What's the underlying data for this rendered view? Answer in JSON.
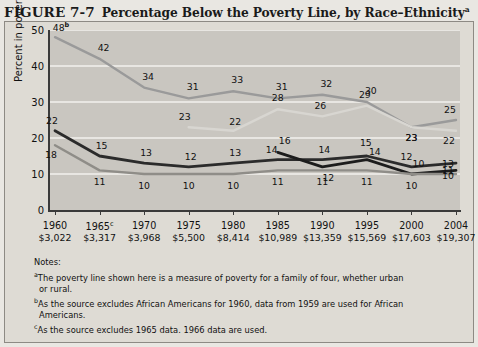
{
  "figure": {
    "number": "FIGURE 7-7",
    "title": "Percentage Below the Poverty Line, by Race–Ethnicity",
    "title_superscript": "a"
  },
  "legend": {
    "position": "top-right",
    "entries": [
      {
        "label": "African Americans",
        "color": "#9a9a9a",
        "weight": "medium"
      },
      {
        "label": "Asian Americans",
        "color": "#1c1c1c",
        "weight": "thick"
      },
      {
        "label": "Latinos",
        "color": "#d8d6d1",
        "weight": "medium"
      },
      {
        "label": "Whites",
        "color": "#8f8d88",
        "weight": "medium"
      },
      {
        "label": "National Average",
        "color": "#2b2b2b",
        "weight": "thick"
      }
    ]
  },
  "notes": {
    "heading": "Notes:",
    "items": [
      {
        "marker": "a",
        "line1": "The poverty line shown here is a measure of poverty for a family of four, whether urban",
        "line2": "or rural."
      },
      {
        "marker": "b",
        "line1": "As the source excludes African Americans for 1960,  data from 1959 are used for African",
        "line2": "Americans."
      },
      {
        "marker": "c",
        "line1": "As the source excludes 1965 data. 1966 data are used.",
        "line2": ""
      }
    ]
  },
  "chart_data": {
    "type": "line",
    "title": "Percentage Below the Poverty Line, by Race–Ethnicity",
    "xlabel": "",
    "ylabel": "Percent in poverty",
    "ylim": [
      0,
      50
    ],
    "yticks": [
      0,
      10,
      20,
      30,
      40,
      50
    ],
    "grid": "horizontal",
    "categories": [
      "1960",
      "1965",
      "1970",
      "1975",
      "1980",
      "1985",
      "1990",
      "1995",
      "2000",
      "2004"
    ],
    "x_superscripts": [
      "",
      "c",
      "",
      "",
      "",
      "",
      "",
      "",
      "",
      ""
    ],
    "poverty_line_values": [
      "$3,022",
      "$3,317",
      "$3,968",
      "$5,500",
      "$8,414",
      "$10,989",
      "$13,359",
      "$15,569",
      "$17,603",
      "$19,307"
    ],
    "series": [
      {
        "name": "African Americans",
        "color": "#9a9a9a",
        "values": [
          48,
          42,
          34,
          31,
          33,
          31,
          32,
          30,
          23,
          25
        ],
        "labels": [
          "48",
          "42",
          "34",
          "31",
          "33",
          "31",
          "32",
          "30",
          "23",
          "25"
        ],
        "first_label_superscript": "b"
      },
      {
        "name": "Latinos",
        "color": "#d8d6d1",
        "values": [
          null,
          null,
          null,
          23,
          22,
          28,
          26,
          29,
          23,
          22
        ],
        "labels": [
          "",
          "",
          "",
          "23",
          "22",
          "28",
          "26",
          "29",
          "23",
          "22"
        ]
      },
      {
        "name": "National Average",
        "color": "#2b2b2b",
        "values": [
          22,
          15,
          13,
          12,
          13,
          14,
          14,
          15,
          12,
          13
        ],
        "labels": [
          "22",
          "15",
          "13",
          "12",
          "13",
          "14",
          "14",
          "15",
          "12",
          "13"
        ]
      },
      {
        "name": "Asian Americans",
        "color": "#1c1c1c",
        "values": [
          null,
          null,
          null,
          null,
          null,
          16,
          12,
          14,
          10,
          11
        ],
        "labels": [
          "",
          "",
          "",
          "",
          "",
          "16",
          "12",
          "14",
          "10",
          "11"
        ]
      },
      {
        "name": "Whites",
        "color": "#8f8d88",
        "values": [
          18,
          11,
          10,
          10,
          10,
          11,
          11,
          11,
          10,
          10
        ],
        "labels": [
          "18",
          "11",
          "10",
          "10",
          "10",
          "11",
          "11",
          "11",
          "10",
          "10"
        ]
      }
    ]
  }
}
